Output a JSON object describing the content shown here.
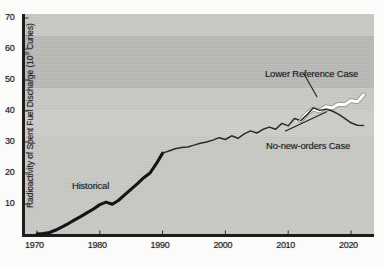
{
  "figure": {
    "alt_title": "Radioactivity of Spent Fuel Discharge",
    "background_color": "#c9c9c6",
    "ink_color": "#1d1d1d",
    "highlight_color": "#ffffff"
  },
  "chart_data": {
    "type": "line",
    "title": "",
    "xlabel": "",
    "ylabel": "Radioactivity of Spent Fuel Discharge (10⁹ Curies)",
    "ylabel_parts": {
      "main": "Radioactivity of Spent Fuel Discharge (10",
      "exponent": "9",
      "tail": " Curies)"
    },
    "xlim": [
      1970,
      2022
    ],
    "ylim": [
      0,
      70
    ],
    "xticks": [
      1970,
      1980,
      1990,
      2000,
      2010,
      2020
    ],
    "xtick_labels": [
      "1970",
      "1980",
      "1990",
      "2000",
      "2010",
      "2020"
    ],
    "yticks": [
      10,
      20,
      30,
      40,
      50,
      60,
      70
    ],
    "ytick_labels": [
      "10",
      "20",
      "30",
      "40",
      "50",
      "60",
      "70"
    ],
    "grid": false,
    "legend_position": "inline-annotations",
    "annotations": [
      {
        "name": "historical",
        "text": "Historical",
        "x": 1977,
        "y": 15
      },
      {
        "name": "lower-reference-case",
        "text": "Lower Reference Case",
        "x": 2008,
        "y": 55
      },
      {
        "name": "no-new-orders-case",
        "text": "No-new-orders Case",
        "x": 2009,
        "y": 31
      }
    ],
    "leader_lines": [
      {
        "name": "lower-reference-leader",
        "from": [
          2012.5,
          52.0
        ],
        "to": [
          2014.6,
          44.5
        ]
      },
      {
        "name": "no-new-orders-leader",
        "from": [
          2009.5,
          33.5
        ],
        "to": [
          2016.2,
          39.8
        ]
      }
    ],
    "series": [
      {
        "name": "Historical",
        "style": "thick-solid-black",
        "color": "#171717",
        "x": [
          1970,
          1971,
          1972,
          1973,
          1974,
          1975,
          1976,
          1977,
          1978,
          1979,
          1980,
          1981,
          1982,
          1983,
          1984,
          1985,
          1986,
          1987,
          1988,
          1989,
          1990
        ],
        "values": [
          0.3,
          0.5,
          0.8,
          1.6,
          2.6,
          3.7,
          4.9,
          6.0,
          7.2,
          8.4,
          9.8,
          10.6,
          9.9,
          11.2,
          13.0,
          14.8,
          16.6,
          18.5,
          20.0,
          23.0,
          26.4
        ]
      },
      {
        "name": "Projection (common trunk)",
        "style": "thin-solid-black",
        "color": "#262626",
        "x": [
          1990,
          1991,
          1992,
          1993,
          1994,
          1995,
          1996,
          1997,
          1998,
          1999,
          2000,
          2001,
          2002,
          2003,
          2004,
          2005,
          2006,
          2007,
          2008,
          2009,
          2010,
          2011,
          2012
        ],
        "values": [
          26.4,
          27.1,
          27.8,
          28.2,
          28.4,
          29.0,
          29.6,
          30.0,
          30.6,
          31.4,
          30.8,
          32.0,
          31.2,
          32.6,
          33.6,
          32.9,
          34.1,
          34.8,
          34.1,
          36.0,
          35.2,
          37.6,
          36.9
        ]
      },
      {
        "name": "Lower Reference Case",
        "style": "thick-solid-white",
        "color": "#ffffff",
        "x": [
          2012,
          2013,
          2014,
          2015,
          2016,
          2017,
          2018,
          2019,
          2020,
          2021,
          2022
        ],
        "values": [
          36.9,
          39.2,
          40.6,
          40.0,
          41.4,
          41.0,
          42.2,
          42.0,
          43.4,
          43.0,
          45.2
        ]
      },
      {
        "name": "No-new-orders Case",
        "style": "thin-solid-black",
        "color": "#262626",
        "x": [
          2012,
          2013,
          2014,
          2015,
          2016,
          2017,
          2018,
          2019,
          2020,
          2021,
          2022
        ],
        "values": [
          36.9,
          38.8,
          41.0,
          40.2,
          40.6,
          40.0,
          39.0,
          37.6,
          36.2,
          35.4,
          35.3
        ]
      }
    ]
  }
}
